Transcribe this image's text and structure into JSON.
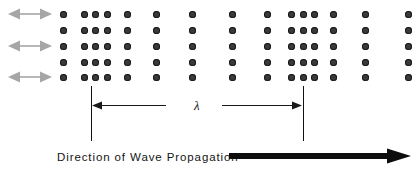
{
  "figure": {
    "width": 419,
    "height": 177,
    "background": "#ffffff"
  },
  "colors": {
    "dot_fill": "#3a3a3a",
    "dot_edge": "#1a1a1a",
    "oscillation_arrow": "#a6a6a6",
    "reference_line": "#111111",
    "lambda_arrow": "#1a1a1a",
    "text": "#141414"
  },
  "labels": {
    "wavelength_symbol": "λ",
    "propagation_caption": "Direction of Wave Propagation"
  },
  "medium": {
    "description": "Grid of particles showing compressions (closely spaced columns) and rarefactions (widely spaced columns)",
    "row_y": [
      14,
      30,
      46,
      62,
      77
    ],
    "dot_diameter": 7,
    "columns": [
      {
        "x": 63,
        "region": "neutral"
      },
      {
        "x": 84,
        "region": "compression"
      },
      {
        "x": 95,
        "region": "compression"
      },
      {
        "x": 107,
        "region": "compression"
      },
      {
        "x": 127,
        "region": "neutral"
      },
      {
        "x": 156,
        "region": "rarefaction"
      },
      {
        "x": 192,
        "region": "rarefaction"
      },
      {
        "x": 232,
        "region": "neutral"
      },
      {
        "x": 267,
        "region": "neutral"
      },
      {
        "x": 291,
        "region": "compression"
      },
      {
        "x": 303,
        "region": "compression"
      },
      {
        "x": 314,
        "region": "compression"
      },
      {
        "x": 333,
        "region": "neutral"
      },
      {
        "x": 365,
        "region": "rarefaction"
      },
      {
        "x": 408,
        "region": "rarefaction"
      }
    ]
  },
  "oscillation_arrows": [
    {
      "row": 1,
      "y": 14,
      "x": 8,
      "length": 44,
      "style": "double-headed"
    },
    {
      "row": 3,
      "y": 46,
      "x": 8,
      "length": 44,
      "style": "double-headed"
    },
    {
      "row": 5,
      "y": 77,
      "x": 8,
      "length": 44,
      "style": "double-headed"
    }
  ],
  "wavelength": {
    "left_line_x": 91,
    "right_line_x": 303,
    "line_top": 86,
    "line_bottom": 141,
    "arrow_y": 105,
    "label_x": 194,
    "label_y": 99,
    "left_arrow": {
      "x": 92,
      "width": 74,
      "head": "left"
    },
    "right_arrow": {
      "x": 222,
      "width": 80,
      "head": "right"
    }
  },
  "propagation": {
    "label_x": 57,
    "label_y": 152,
    "arrow_x": 229,
    "arrow_y": 152,
    "arrow_width": 182,
    "arrow_thickness": 6
  }
}
